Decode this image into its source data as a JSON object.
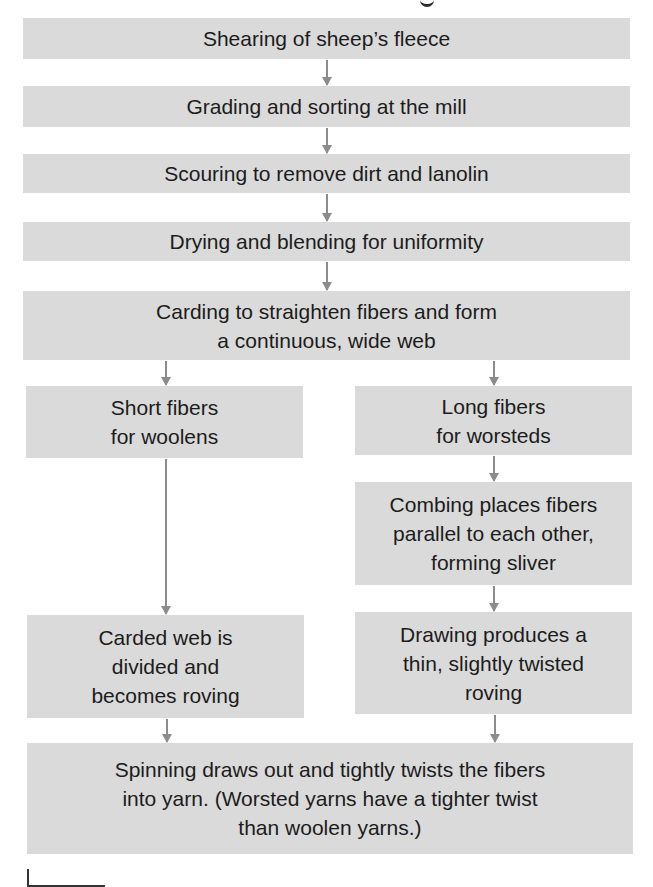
{
  "diagram": {
    "title_fragment": "",
    "steps": {
      "shearing": "Shearing of sheep’s fleece",
      "grading": "Grading and sorting at the mill",
      "scouring": "Scouring to remove dirt and lanolin",
      "drying": "Drying and blending for uniformity",
      "carding": "Carding to straighten fibers and form\na continuous, wide web",
      "short_fibers": "Short fibers\nfor woolens",
      "long_fibers": "Long fibers\nfor worsteds",
      "combing": "Combing places fibers\nparallel to each other,\nforming sliver",
      "carded_web": "Carded web is\ndivided and\nbecomes roving",
      "drawing": "Drawing produces a\nthin, slightly twisted\nroving",
      "spinning": "Spinning draws out and tightly twists the fibers\ninto yarn. (Worsted yarns have a tighter twist\nthan woolen yarns.)"
    },
    "colors": {
      "box_fill": "#dadada",
      "arrow": "#8c8c8c",
      "text": "#1c1c1c"
    }
  }
}
